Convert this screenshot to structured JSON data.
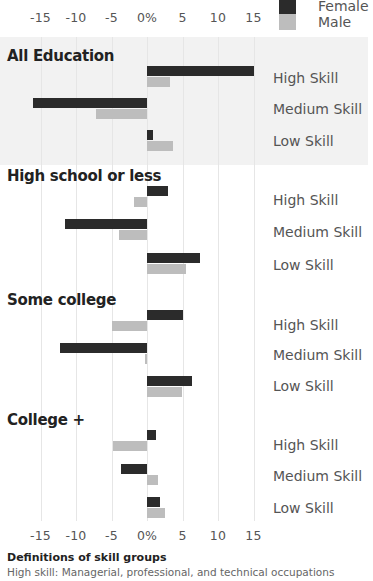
{
  "legend": {
    "female_label": "Female",
    "male_label": "Male",
    "female_color": "#2b2b2b",
    "male_color": "#bdbdbd"
  },
  "axis": {
    "ticks": [
      "-15",
      "-10",
      "-5",
      "0%",
      "5",
      "10",
      "15"
    ],
    "tick_values": [
      -15,
      -10,
      -5,
      0,
      5,
      10,
      15
    ]
  },
  "sections": [
    {
      "title": "All Education",
      "labels": [
        "High Skill",
        "Medium Skill",
        "Low Skill"
      ]
    },
    {
      "title": "High school or less",
      "labels": [
        "High Skill",
        "Medium Skill",
        "Low Skill"
      ]
    },
    {
      "title": "Some college",
      "labels": [
        "High Skill",
        "Medium Skill",
        "Low Skill"
      ]
    },
    {
      "title": "College +",
      "labels": [
        "High Skill",
        "Medium Skill",
        "Low Skill"
      ]
    }
  ],
  "definitions": {
    "title": "Definitions of skill groups",
    "high": "High skill: Managerial, professional, and technical occupations"
  },
  "chart_data": {
    "type": "bar",
    "orientation": "horizontal",
    "title": "",
    "xlabel": "%",
    "ylabel": "",
    "xlim": [
      -15,
      15
    ],
    "grid": true,
    "legend_position": "top-right",
    "groups": [
      "All Education",
      "High school or less",
      "Some college",
      "College +"
    ],
    "categories": [
      "High Skill",
      "Medium Skill",
      "Low Skill"
    ],
    "series": [
      {
        "name": "Female",
        "values": {
          "All Education": [
            15.0,
            -16.1,
            0.8
          ],
          "High school or less": [
            2.9,
            -11.5,
            7.4
          ],
          "Some college": [
            5.0,
            -12.2,
            6.3
          ],
          "College +": [
            1.2,
            -3.6,
            1.8
          ]
        }
      },
      {
        "name": "Male",
        "values": {
          "All Education": [
            3.3,
            -7.2,
            3.6
          ],
          "High school or less": [
            -1.9,
            -3.9,
            5.5
          ],
          "Some college": [
            -4.9,
            -0.3,
            4.9
          ],
          "College +": [
            -4.8,
            1.6,
            2.5
          ]
        }
      }
    ]
  }
}
